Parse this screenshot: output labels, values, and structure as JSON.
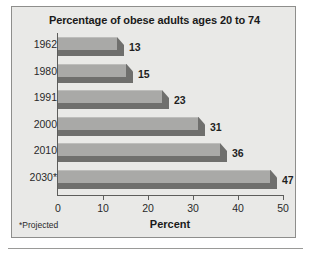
{
  "figure": {
    "background_color": "#ffffff",
    "panel_color": "#e9e9e7",
    "border_color": "#8e8e8c",
    "bar_face_color": "#a9a9a7",
    "bar_shadow_color": "#6f6f6d",
    "axis_color": "#5d5d5b",
    "text_color": "#1a1a1a"
  },
  "footnote": "*Projected",
  "chart_data": {
    "type": "bar",
    "orientation": "horizontal",
    "title": "Percentage of obese adults ages 20 to 74",
    "subtitle": "",
    "xlabel": "Percent",
    "ylabel": "",
    "categories": [
      "1962",
      "1980",
      "1991",
      "2000",
      "2010",
      "2030*"
    ],
    "values": [
      13,
      15,
      23,
      31,
      36,
      47
    ],
    "data_labels": [
      "13",
      "15",
      "23",
      "31",
      "36",
      "47"
    ],
    "xlim": [
      0,
      50
    ],
    "xticks": [
      0,
      10,
      20,
      30,
      40,
      50
    ],
    "xtick_labels": [
      "0",
      "10",
      "20",
      "30",
      "40",
      "50"
    ],
    "grid": false,
    "legend": false,
    "annotations": [
      "*Projected"
    ],
    "style": "3d-bar",
    "series": [
      {
        "name": "Percentage of obese adults ages 20 to 74",
        "values": [
          13,
          15,
          23,
          31,
          36,
          47
        ]
      }
    ]
  }
}
